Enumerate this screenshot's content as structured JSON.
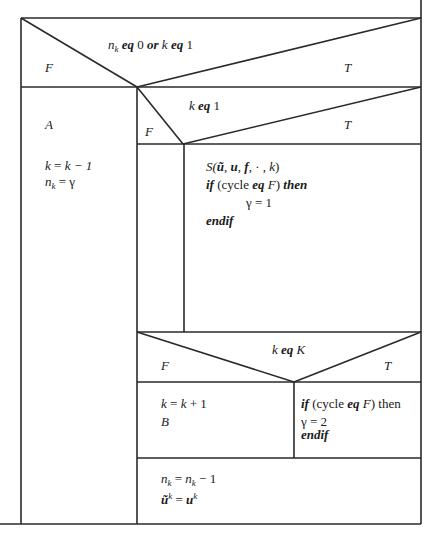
{
  "diagram": {
    "type": "nassi-shneiderman",
    "decision1": {
      "condition_parts": [
        "n",
        "k",
        "eq",
        "0",
        "or",
        "k",
        "eq",
        "1"
      ],
      "false_label": "F",
      "true_label": "T",
      "false_branch": {
        "label": "A",
        "line1": {
          "lhs": "k",
          "op": "=",
          "rhs": "k − 1"
        },
        "line2": {
          "var": "n",
          "sub": "k",
          "op": "= γ"
        }
      }
    },
    "decision2": {
      "condition": {
        "var": "k",
        "kw": "eq",
        "val": "1"
      },
      "false_label": "F",
      "true_label": "T",
      "true_branch": {
        "call": {
          "name": "S(",
          "a1": "ũ",
          "sep1": ", ",
          "a2": "u",
          "sep2": ", ",
          "a3": "f",
          "rest": ", · , ",
          "a4": "k",
          "close": ")"
        },
        "if_kw": "if",
        "cond_open": " (cycle ",
        "eq_kw": "eq",
        "cond_var": " F",
        "cond_close": ") ",
        "then_kw": "then",
        "assign": "γ = 1",
        "endif_kw": "endif"
      }
    },
    "decision3": {
      "condition": {
        "var": "k",
        "kw": "eq",
        "val": "K"
      },
      "false_label": "F",
      "true_label": "T",
      "false_branch": {
        "line1": {
          "lhs": "k",
          "op": " = ",
          "rhs_var": "k",
          "rhs": " + 1"
        },
        "line2": "B"
      },
      "true_branch": {
        "if_kw": "if",
        "cond_open": " (cycle ",
        "eq_kw": "eq",
        "cond_var": " F",
        "cond_close": ") then",
        "assign": "γ = 2",
        "endif_kw": "endif"
      }
    },
    "final": {
      "line1": {
        "var": "n",
        "sub": "k",
        "op": " = ",
        "var2": "n",
        "sub2": "k",
        "rest": " − 1"
      },
      "line2": {
        "var": "ũ",
        "sup": "k",
        "op": " = ",
        "var2": "u",
        "sup2": "k"
      }
    }
  }
}
